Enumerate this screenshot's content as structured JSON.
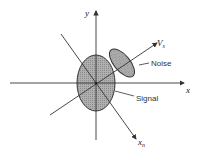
{
  "diagram": {
    "axes": {
      "horizontal_label": "x",
      "vertical_label": "y"
    },
    "rotated_axes": {
      "principal_label": "V",
      "principal_subscript": "s",
      "secondary_label": "x",
      "secondary_subscript": "n"
    },
    "regions": {
      "noise_label": "Noise",
      "signal_label": "Signal"
    },
    "colors": {
      "fill": "#a8a8a8",
      "stroke": "#333333",
      "text": "#333333"
    }
  }
}
